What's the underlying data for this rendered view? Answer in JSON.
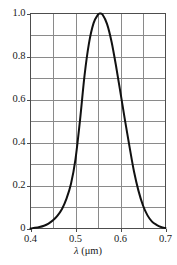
{
  "chart_data": {
    "type": "line",
    "title": "",
    "subtitle": "",
    "xlabel": "λ (μm)",
    "ylabel": "",
    "xlim": [
      0.4,
      0.7
    ],
    "ylim": [
      0.0,
      1.0
    ],
    "grid": true,
    "legend": null,
    "x_ticks_labeled": [
      0.4,
      0.5,
      0.6,
      0.7
    ],
    "x_tick_labels": [
      "0.4",
      "0.5",
      "0.6",
      "0.7"
    ],
    "x_minor_step": 0.05,
    "y_ticks_labeled": [
      0,
      0.2,
      0.4,
      0.6,
      0.8,
      1.0
    ],
    "y_tick_labels": [
      "0",
      "0.2",
      "0.4",
      "0.6",
      "0.8",
      "1.0"
    ],
    "y_minor_step": 0.1,
    "line_color": "#111111",
    "line_width": 2.0,
    "grid_color": "#8a8a8a",
    "frame_color": "#4d4d4d",
    "peak": {
      "x": 0.555,
      "y": 1.0
    },
    "x": [
      0.4,
      0.41,
      0.42,
      0.43,
      0.44,
      0.45,
      0.46,
      0.47,
      0.48,
      0.49,
      0.5,
      0.51,
      0.52,
      0.53,
      0.54,
      0.55,
      0.555,
      0.56,
      0.57,
      0.58,
      0.59,
      0.6,
      0.61,
      0.62,
      0.63,
      0.64,
      0.65,
      0.66,
      0.67,
      0.68,
      0.69,
      0.7
    ],
    "y": [
      0.0,
      0.003,
      0.007,
      0.013,
      0.023,
      0.038,
      0.06,
      0.091,
      0.139,
      0.208,
      0.323,
      0.503,
      0.71,
      0.862,
      0.954,
      0.995,
      1.0,
      0.995,
      0.952,
      0.87,
      0.757,
      0.631,
      0.503,
      0.381,
      0.265,
      0.175,
      0.107,
      0.061,
      0.032,
      0.017,
      0.007,
      0.002
    ],
    "annotations": []
  },
  "axis": {
    "x_title": "λ (μm)",
    "x_title_symbol": "λ",
    "x_title_unit": "(μm)"
  }
}
